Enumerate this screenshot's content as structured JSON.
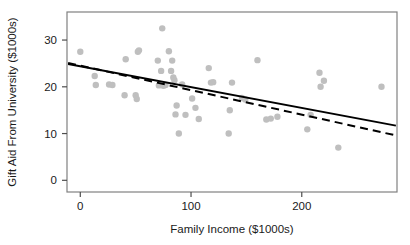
{
  "chart_data": {
    "type": "scatter",
    "title": "",
    "xlabel": "Family Income ($1000s)",
    "ylabel": "Gift Aid From University ($1000s)",
    "xlim": [
      -12,
      286
    ],
    "ylim": [
      -2.5,
      36
    ],
    "xticks": [
      0,
      100,
      200
    ],
    "xtick_labels": [
      "0",
      "100",
      "200"
    ],
    "yticks": [
      0,
      10,
      20,
      30
    ],
    "ytick_labels": [
      "0",
      "10",
      "20",
      "30"
    ],
    "grid": false,
    "legend": "none",
    "point_color": "#bfbfbf",
    "point_radius": 3.2,
    "frame_color": "#808080",
    "axis_color": "#4d4d4d",
    "points": [
      {
        "x": 0,
        "y": 27.5
      },
      {
        "x": 13,
        "y": 22.3
      },
      {
        "x": 14,
        "y": 20.4
      },
      {
        "x": 26,
        "y": 20.5
      },
      {
        "x": 29,
        "y": 20.4
      },
      {
        "x": 40,
        "y": 18.2
      },
      {
        "x": 41,
        "y": 25.9
      },
      {
        "x": 50,
        "y": 18.2
      },
      {
        "x": 51,
        "y": 17.4
      },
      {
        "x": 52,
        "y": 27.5
      },
      {
        "x": 53,
        "y": 27.8
      },
      {
        "x": 70,
        "y": 25.6
      },
      {
        "x": 71,
        "y": 20.3
      },
      {
        "x": 73,
        "y": 23.4
      },
      {
        "x": 74,
        "y": 32.5
      },
      {
        "x": 75,
        "y": 20.2
      },
      {
        "x": 77,
        "y": 20.4
      },
      {
        "x": 80,
        "y": 27.6
      },
      {
        "x": 82,
        "y": 23.4
      },
      {
        "x": 83,
        "y": 25.6
      },
      {
        "x": 84,
        "y": 22.0
      },
      {
        "x": 85,
        "y": 21.4
      },
      {
        "x": 86,
        "y": 14.1
      },
      {
        "x": 87,
        "y": 16.0
      },
      {
        "x": 89,
        "y": 10.0
      },
      {
        "x": 92,
        "y": 20.5
      },
      {
        "x": 95,
        "y": 14.0
      },
      {
        "x": 101,
        "y": 17.5
      },
      {
        "x": 104,
        "y": 15.5
      },
      {
        "x": 107,
        "y": 13.1
      },
      {
        "x": 116,
        "y": 24.0
      },
      {
        "x": 118,
        "y": 20.9
      },
      {
        "x": 120,
        "y": 21.0
      },
      {
        "x": 134,
        "y": 10.0
      },
      {
        "x": 135,
        "y": 15.0
      },
      {
        "x": 137,
        "y": 20.9
      },
      {
        "x": 146,
        "y": 17.6
      },
      {
        "x": 149,
        "y": 17.3
      },
      {
        "x": 160,
        "y": 25.7
      },
      {
        "x": 168,
        "y": 13.0
      },
      {
        "x": 172,
        "y": 13.2
      },
      {
        "x": 178,
        "y": 13.6
      },
      {
        "x": 205,
        "y": 10.9
      },
      {
        "x": 208,
        "y": 14.0
      },
      {
        "x": 216,
        "y": 23.0
      },
      {
        "x": 217,
        "y": 20.0
      },
      {
        "x": 220,
        "y": 21.3
      },
      {
        "x": 233,
        "y": 7.0
      },
      {
        "x": 272,
        "y": 20.0
      }
    ],
    "lines": [
      {
        "name": "least-squares-regression-line",
        "style": "solid",
        "color": "#000000",
        "x_start": -11,
        "y_start": 24.9,
        "x_end": 285,
        "y_end": 11.7
      },
      {
        "name": "alternate-fit-line",
        "style": "dashed",
        "color": "#000000",
        "x_start": -11,
        "y_start": 25.1,
        "x_end": 285,
        "y_end": 9.6
      }
    ]
  },
  "axes": {
    "x_title": "Family Income ($1000s)",
    "y_title": "Gift Aid From University ($1000s)"
  }
}
